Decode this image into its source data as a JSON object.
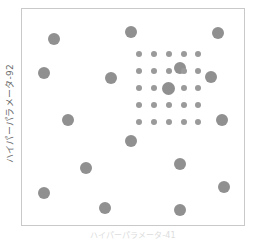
{
  "figure": {
    "background_color": "#ffffff",
    "frame_color": "#c9c9c9"
  },
  "axes": {
    "ylabel": "ハイパーパラメータ-92",
    "xlabel": "ハイパーパラメータ-41"
  },
  "chart_data": {
    "type": "scatter",
    "title": "",
    "xlabel": "ハイパーパラメータ-41",
    "ylabel": "ハイパーパラメータ-92",
    "grid": false,
    "legend": null,
    "xlim": [
      0,
      1
    ],
    "ylim": [
      0,
      1
    ],
    "marker_color": "#909090",
    "series": [
      {
        "name": "random-search-points",
        "marker": "circle",
        "marker_size_px": 12,
        "color": "#909090",
        "points": [
          {
            "x": 0.143,
            "y": 0.862
          },
          {
            "x": 0.098,
            "y": 0.702
          },
          {
            "x": 0.402,
            "y": 0.679
          },
          {
            "x": 0.205,
            "y": 0.486
          },
          {
            "x": 0.29,
            "y": 0.266
          },
          {
            "x": 0.098,
            "y": 0.146
          },
          {
            "x": 0.375,
            "y": 0.08
          },
          {
            "x": 0.491,
            "y": 0.895
          },
          {
            "x": 0.491,
            "y": 0.39
          },
          {
            "x": 0.71,
            "y": 0.725
          },
          {
            "x": 0.884,
            "y": 0.89
          },
          {
            "x": 0.853,
            "y": 0.683
          },
          {
            "x": 0.902,
            "y": 0.486
          },
          {
            "x": 0.71,
            "y": 0.284
          },
          {
            "x": 0.911,
            "y": 0.174
          },
          {
            "x": 0.71,
            "y": 0.069
          }
        ]
      },
      {
        "name": "grid-search-points",
        "marker": "circle",
        "marker_size_px": 6,
        "color": "#9a9a9a",
        "grid_cols": 5,
        "grid_rows": 5,
        "grid_x": [
          0.527,
          0.594,
          0.661,
          0.728,
          0.795
        ],
        "grid_y": [
          0.792,
          0.713,
          0.634,
          0.555,
          0.476
        ],
        "highlight": {
          "x": 0.661,
          "y": 0.634,
          "marker_size_px": 13,
          "color": "#8f8f8f"
        }
      }
    ]
  }
}
